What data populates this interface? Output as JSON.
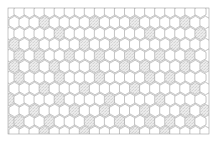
{
  "diagram": {
    "type": "honeycomb-lattice",
    "background_color": "#ffffff",
    "cell_stroke_color": "#7b7b7b",
    "cell_fill_color": "#ffffff",
    "shaded_cell_fill_color": "#e6e6e6",
    "shaded_cell_stipple_color": "#9a9a9a",
    "frame_stroke_color": "#8e8e8e",
    "frame": {
      "x": 8,
      "y": 8,
      "width": 201,
      "height": 126
    },
    "lattice": {
      "columns": 20,
      "rows": 12,
      "orientation": "pointy-top",
      "hex_width": 11.2,
      "hex_height": 12.6,
      "column_step": 10.05,
      "row_step": 11.0,
      "origin_x": 9.5,
      "origin_y": 11.5
    },
    "shaded_cells": [
      [
        1,
        3
      ],
      [
        1,
        8
      ],
      [
        1,
        12
      ],
      [
        1,
        17
      ],
      [
        2,
        5
      ],
      [
        2,
        14
      ],
      [
        2,
        19
      ],
      [
        3,
        0
      ],
      [
        3,
        2
      ],
      [
        3,
        7
      ],
      [
        3,
        10
      ],
      [
        3,
        16
      ],
      [
        4,
        1
      ],
      [
        4,
        3
      ],
      [
        4,
        6
      ],
      [
        4,
        9
      ],
      [
        4,
        12
      ],
      [
        4,
        15
      ],
      [
        4,
        18
      ],
      [
        5,
        0
      ],
      [
        5,
        2
      ],
      [
        5,
        4
      ],
      [
        5,
        8
      ],
      [
        5,
        11
      ],
      [
        5,
        13
      ],
      [
        5,
        17
      ],
      [
        5,
        19
      ],
      [
        6,
        1
      ],
      [
        6,
        5
      ],
      [
        6,
        9
      ],
      [
        6,
        14
      ],
      [
        6,
        16
      ],
      [
        7,
        3
      ],
      [
        7,
        7
      ],
      [
        7,
        12
      ],
      [
        7,
        18
      ],
      [
        8,
        0
      ],
      [
        8,
        5
      ],
      [
        8,
        10
      ],
      [
        8,
        15
      ],
      [
        9,
        2
      ],
      [
        9,
        6
      ],
      [
        9,
        9
      ],
      [
        9,
        13
      ],
      [
        9,
        17
      ],
      [
        9,
        19
      ],
      [
        10,
        0
      ],
      [
        10,
        1
      ],
      [
        10,
        4
      ],
      [
        10,
        8
      ],
      [
        10,
        11
      ],
      [
        10,
        14
      ],
      [
        10,
        16
      ],
      [
        10,
        18
      ],
      [
        11,
        3
      ],
      [
        11,
        7
      ],
      [
        11,
        12
      ],
      [
        11,
        15
      ]
    ]
  }
}
